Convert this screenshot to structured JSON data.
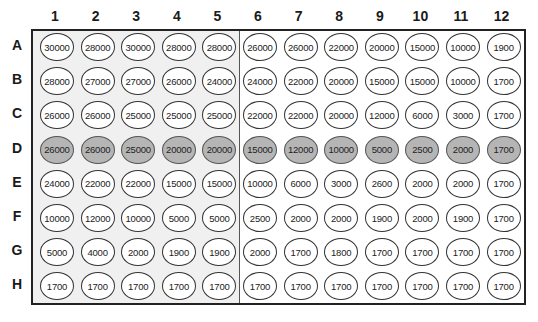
{
  "plate": {
    "columns": [
      "1",
      "2",
      "3",
      "4",
      "5",
      "6",
      "7",
      "8",
      "9",
      "10",
      "11",
      "12"
    ],
    "rows": [
      "A",
      "B",
      "C",
      "D",
      "E",
      "F",
      "G",
      "H"
    ],
    "highlighted_row": "D",
    "shaded_columns": [
      "1",
      "2",
      "3",
      "4",
      "5"
    ],
    "colors": {
      "highlight_fill": "#b5b5b5",
      "shaded_bg": "#f0f0f0",
      "well_fill": "#ffffff"
    },
    "values": [
      [
        "30000",
        "28000",
        "30000",
        "28000",
        "28000",
        "26000",
        "26000",
        "22000",
        "20000",
        "15000",
        "10000",
        "1900"
      ],
      [
        "28000",
        "27000",
        "27000",
        "26000",
        "24000",
        "24000",
        "22000",
        "20000",
        "15000",
        "15000",
        "10000",
        "1700"
      ],
      [
        "26000",
        "26000",
        "25000",
        "25000",
        "25000",
        "22000",
        "22000",
        "20000",
        "12000",
        "6000",
        "3000",
        "1700"
      ],
      [
        "26000",
        "26000",
        "25000",
        "20000",
        "20000",
        "15000",
        "12000",
        "10000",
        "5000",
        "2500",
        "2000",
        "1700"
      ],
      [
        "24000",
        "22000",
        "22000",
        "15000",
        "15000",
        "10000",
        "6000",
        "3000",
        "2600",
        "2000",
        "2000",
        "1700"
      ],
      [
        "10000",
        "12000",
        "10000",
        "5000",
        "5000",
        "2500",
        "2000",
        "2000",
        "1900",
        "2000",
        "1900",
        "1700"
      ],
      [
        "5000",
        "4000",
        "2000",
        "1900",
        "1900",
        "2000",
        "1700",
        "1800",
        "1700",
        "1700",
        "1700",
        "1700"
      ],
      [
        "1700",
        "1700",
        "1700",
        "1700",
        "1700",
        "1700",
        "1700",
        "1700",
        "1700",
        "1700",
        "1700",
        "1700"
      ]
    ]
  }
}
